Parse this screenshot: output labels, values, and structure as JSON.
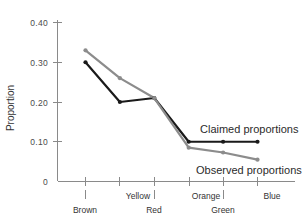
{
  "chart_data": {
    "type": "line",
    "title": "",
    "xlabel": "",
    "ylabel": "Proportion",
    "categories": [
      "Brown",
      "Yellow",
      "Red",
      "Orange",
      "Green",
      "Blue"
    ],
    "ylim": [
      0,
      0.4
    ],
    "yticks": [
      "0",
      "0.10",
      "0.20",
      "0.30",
      "0.40"
    ],
    "ytick_values": [
      0,
      0.1,
      0.2,
      0.3,
      0.4
    ],
    "grid": false,
    "legend_position": "inline-annotation",
    "series": [
      {
        "name": "Claimed proportions",
        "color": "#1a1a1a",
        "values": [
          0.3,
          0.2,
          0.21,
          0.1,
          0.1,
          0.1
        ]
      },
      {
        "name": "Observed proportions",
        "color": "#8c8c8c",
        "values": [
          0.33,
          0.26,
          0.21,
          0.085,
          0.073,
          0.055
        ]
      }
    ],
    "annotations": [
      {
        "text": "Claimed proportions",
        "series": "Claimed proportions"
      },
      {
        "text": "Observed proportions",
        "series": "Observed proportions"
      }
    ]
  },
  "axes": {
    "y_title": "Proportion",
    "y_labels": [
      "0.40",
      "0.30",
      "0.20",
      "0.10",
      "0"
    ],
    "x_labels_upper": [
      "Yellow",
      "Orange",
      "Blue"
    ],
    "x_labels_lower": [
      "Brown",
      "Red",
      "Green"
    ]
  },
  "colors": {
    "claimed": "#1a1a1a",
    "observed": "#8c8c8c",
    "axis": "#8a8a8a",
    "text": "#333333",
    "background": "#ffffff"
  }
}
